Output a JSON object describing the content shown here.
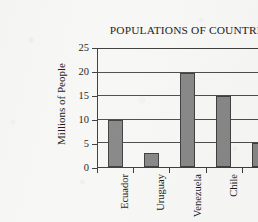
{
  "chart_data": {
    "type": "bar",
    "title": "POPULATIONS OF COUNTRIES",
    "xlabel": "",
    "ylabel": "Millions of People",
    "categories": [
      "Ecuador",
      "Uruguay",
      "Venezuela",
      "Chile",
      "Paraguay"
    ],
    "values": [
      10,
      3,
      20,
      15,
      5
    ],
    "ylim": [
      0,
      25
    ],
    "ytick_labels": [
      "0",
      "5",
      "10",
      "15",
      "20",
      "25"
    ],
    "ytick_values": [
      0,
      5,
      10,
      15,
      20,
      25
    ],
    "grid": true,
    "legend": "none",
    "bar_color": "#858585",
    "bar_edge_color": "#3d3d3d",
    "axis_color": "#3a3a3a",
    "text_color": "#161616",
    "background_color": "#f7f7f5",
    "category_label_rotation": -90
  }
}
